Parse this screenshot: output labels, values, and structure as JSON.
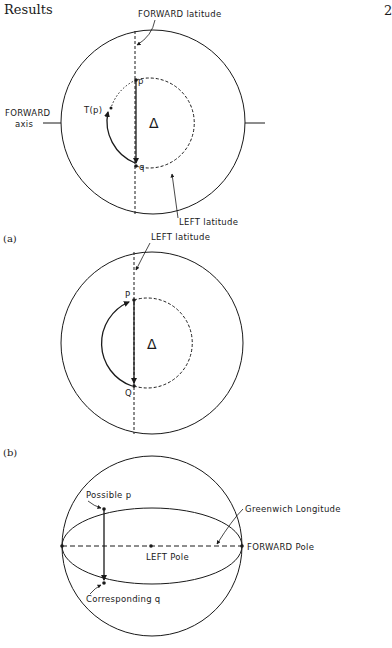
{
  "page": {
    "header": "Results",
    "page_number": "2"
  },
  "figure_a": {
    "caption": "(a)",
    "forward_latitude_label": "FORWARD latitude",
    "forward_axis_label_line1": "FORWARD",
    "forward_axis_label_line2": "axis",
    "left_latitude_label": "LEFT latitude",
    "point_p": "p",
    "point_q": "q",
    "transform_label": "T(p)",
    "delta_symbol": "Δ"
  },
  "figure_b": {
    "caption": "(b)",
    "left_latitude_label": "LEFT latitude",
    "point_p": "P",
    "point_q": "Q",
    "delta_symbol": "Δ"
  },
  "figure_c": {
    "possible_p_label": "Possible p",
    "corresponding_q_label": "Corresponding q",
    "greenwich_label": "Greenwich Longitude",
    "forward_pole_label": "FORWARD Pole",
    "left_pole_label": "LEFT Pole"
  }
}
